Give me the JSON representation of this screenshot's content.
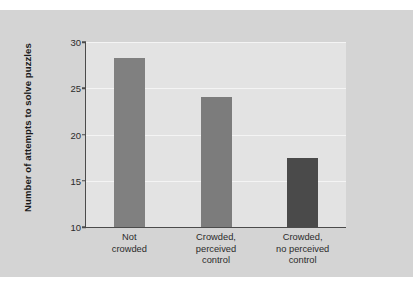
{
  "chart_data": {
    "type": "bar",
    "title": "",
    "xlabel": "",
    "ylabel": "Number of attempts to solve puzzles",
    "categories": [
      "Not crowded",
      "Crowded, perceived control",
      "Crowded, no perceived control"
    ],
    "category_lines": [
      [
        "Not",
        "crowded"
      ],
      [
        "Crowded,",
        "perceived",
        "control"
      ],
      [
        "Crowded,",
        "no perceived",
        "control"
      ]
    ],
    "values": [
      28.3,
      24.1,
      17.5
    ],
    "ylim": [
      10,
      30
    ],
    "yticks": [
      10,
      15,
      20,
      25,
      30
    ],
    "ytick_labels": [
      "10",
      "15",
      "20",
      "25",
      "30"
    ],
    "grid": true,
    "legend": "none",
    "bar_colors": [
      "#808080",
      "#7c7c7c",
      "#4a4a4a"
    ]
  },
  "style": {
    "figure_background": "#ffffff",
    "panel_background": "#d4d4d4",
    "plot_background": "#e3e3e3",
    "gridline_color": "#f4f4f4",
    "axis_color": "#4b4b4b",
    "text_color": "#2b2b2b"
  }
}
